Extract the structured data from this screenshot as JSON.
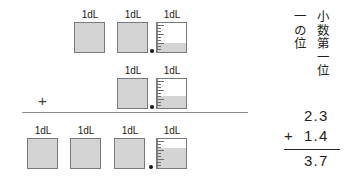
{
  "diagram": {
    "unit_label": "1dL",
    "plus_sign": "+",
    "rows": [
      {
        "name": "addend-1",
        "value": "2.3",
        "full_units": 2,
        "partial_fill": 0.3
      },
      {
        "name": "addend-2",
        "value": "1.4",
        "full_units": 1,
        "partial_fill": 0.4
      },
      {
        "name": "sum",
        "value": "3.7",
        "full_units": 3,
        "partial_fill": 0.7
      }
    ]
  },
  "place_headings": {
    "ones_place": "一の位",
    "first_decimal_place": "小数第一位"
  },
  "calculation": {
    "operand_top": "2.3",
    "operator": "+",
    "operand_bottom": "1.4",
    "result": "3.7"
  },
  "colors": {
    "liquid": "#d4d4d4",
    "outline": "#7a7a7a",
    "text": "#231f20",
    "rule": "#8d8d8d",
    "dot": "#161616"
  }
}
